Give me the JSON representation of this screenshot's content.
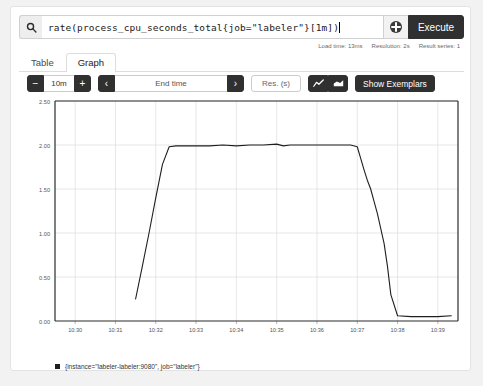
{
  "query": {
    "search_icon": "search-icon",
    "value": "rate(process_cpu_seconds_total{job=\"labeler\"}[1m])",
    "placeholder": "Expression (press Shift+Enter for newlines)",
    "metrics_explorer_icon": "globe-icon",
    "execute_label": "Execute"
  },
  "meta": {
    "load_time": "Load time: 13ms",
    "resolution": "Resolution: 2s",
    "result_series": "Result series: 1"
  },
  "tabs": [
    {
      "label": "Table",
      "active": false
    },
    {
      "label": "Graph",
      "active": true
    }
  ],
  "toolbar": {
    "decrease_label": "−",
    "range_value": "10m",
    "increase_label": "+",
    "prev_label": "‹",
    "end_time_value": "End time",
    "next_label": "›",
    "resolution_placeholder": "Res. (s)",
    "line_chart_icon": "line-chart-icon",
    "stacked_chart_icon": "stacked-chart-icon",
    "show_exemplars_label": "Show Exemplars"
  },
  "legend": {
    "series_label": "{instance=\"labeler-labeler:9080\", job=\"labeler\"}",
    "color": "#1f1f1f"
  },
  "chart_data": {
    "type": "line",
    "title": "",
    "xlabel": "",
    "ylabel": "",
    "ylim": [
      0.0,
      2.5
    ],
    "yticks": [
      0.0,
      0.5,
      1.0,
      1.5,
      2.0,
      2.5
    ],
    "ytick_labels": [
      "0.00",
      "0.50",
      "1.00",
      "1.50",
      "2.00",
      "2.50"
    ],
    "xticks": [
      "10:30",
      "10:31",
      "10:32",
      "10:33",
      "10:34",
      "10:35",
      "10:36",
      "10:37",
      "10:38",
      "10:39"
    ],
    "xlim": [
      "10:29:30",
      "10:39:30"
    ],
    "grid": true,
    "legend_position": "bottom",
    "line_color": "#1f1f1f",
    "series": [
      {
        "name": "{instance=\"labeler-labeler:9080\", job=\"labeler\"}",
        "x": [
          "10:31:30",
          "10:31:40",
          "10:31:50",
          "10:32:00",
          "10:32:10",
          "10:32:20",
          "10:32:30",
          "10:32:45",
          "10:33:00",
          "10:33:20",
          "10:33:40",
          "10:34:00",
          "10:34:20",
          "10:34:40",
          "10:35:00",
          "10:35:10",
          "10:35:20",
          "10:35:40",
          "10:36:00",
          "10:36:20",
          "10:36:40",
          "10:36:50",
          "10:37:00",
          "10:37:05",
          "10:37:10",
          "10:37:15",
          "10:37:20",
          "10:37:25",
          "10:37:30",
          "10:37:35",
          "10:37:40",
          "10:37:45",
          "10:37:50",
          "10:38:00",
          "10:38:20",
          "10:38:40",
          "10:39:00",
          "10:39:20"
        ],
        "values": [
          0.25,
          0.62,
          1.0,
          1.4,
          1.78,
          1.98,
          1.99,
          1.99,
          1.99,
          1.99,
          2.0,
          1.99,
          2.0,
          2.0,
          2.01,
          1.99,
          2.0,
          2.0,
          2.0,
          2.0,
          2.0,
          2.0,
          1.98,
          1.85,
          1.72,
          1.6,
          1.5,
          1.36,
          1.22,
          1.05,
          0.88,
          0.62,
          0.3,
          0.06,
          0.05,
          0.05,
          0.05,
          0.06
        ]
      }
    ]
  }
}
